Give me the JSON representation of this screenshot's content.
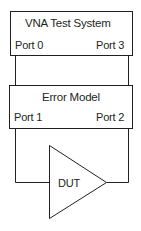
{
  "diagram": {
    "vna_box": {
      "title": "VNA Test System",
      "port_left": "Port 0",
      "port_right": "Port 3"
    },
    "error_model_box": {
      "title": "Error Model",
      "port_left": "Port 1",
      "port_right": "Port 2"
    },
    "dut": {
      "label": "DUT"
    },
    "colors": {
      "stroke": "#231f20",
      "background": "#ffffff"
    }
  }
}
